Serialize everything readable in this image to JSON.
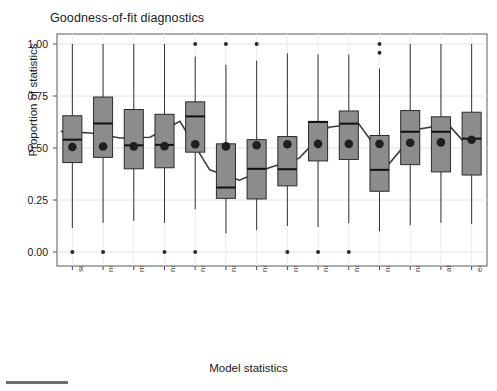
{
  "chart_data": {
    "type": "box",
    "title": "Goodness-of-fit diagnostics",
    "xlabel": "Model statistics",
    "ylabel": "Proportion of statistics",
    "ylim": [
      0.0,
      1.0
    ],
    "ytick_labels": [
      "0.00",
      "0.25",
      "0.50",
      "0.75",
      "1.00"
    ],
    "ytick_values": [
      0.0,
      0.25,
      0.5,
      0.75,
      1.0
    ],
    "grid": true,
    "legend": "none",
    "box_fill": "#8c8c8c",
    "box_stroke": "#2b2b2b",
    "mean_marker_color": "#1f1f1f",
    "mean_line_color": "#3d3d3d",
    "categories": [
      "sum",
      "nonzero",
      "mutual min",
      "nodeicovar",
      "nodeicovar",
      "nodeofactor.sum.Disc3 1",
      "nodeofactor.sum.Disc3 2",
      "nodeifactor.sum.Disc3.1",
      "nodeifactor.sum.Disc3.2",
      "nodematch.sum.Disc3",
      "nodeocov.sum.Citations",
      "nodeicov.sum.Citations",
      "absdiff.sum.Citations",
      "edgecov.sum.friend"
    ],
    "boxes": [
      {
        "category": "sum",
        "whisker_low": 0.115,
        "q1": 0.43,
        "median": 0.54,
        "q3": 0.655,
        "whisker_high": 1.0,
        "mean": 0.505,
        "outliers": [
          0.0
        ]
      },
      {
        "category": "nonzero",
        "whisker_low": 0.14,
        "q1": 0.455,
        "median": 0.618,
        "q3": 0.745,
        "whisker_high": 1.0,
        "mean": 0.507,
        "outliers": [
          0.0
        ]
      },
      {
        "category": "mutual min",
        "whisker_low": 0.15,
        "q1": 0.4,
        "median": 0.513,
        "q3": 0.685,
        "whisker_high": 1.0,
        "mean": 0.508,
        "outliers": []
      },
      {
        "category": "nodeicovar",
        "whisker_low": 0.14,
        "q1": 0.405,
        "median": 0.515,
        "q3": 0.662,
        "whisker_high": 1.0,
        "mean": 0.509,
        "outliers": [
          0.0
        ]
      },
      {
        "category": "nodeicovar",
        "whisker_low": 0.205,
        "q1": 0.48,
        "median": 0.652,
        "q3": 0.722,
        "whisker_high": 0.94,
        "mean": 0.518,
        "outliers": [
          0.0,
          1.0
        ]
      },
      {
        "category": "nodeofactor.sum.Disc3 1",
        "whisker_low": 0.09,
        "q1": 0.258,
        "median": 0.31,
        "q3": 0.52,
        "whisker_high": 0.9,
        "mean": 0.508,
        "outliers": [
          1.0
        ]
      },
      {
        "category": "nodeofactor.sum.Disc3 2",
        "whisker_low": 0.105,
        "q1": 0.255,
        "median": 0.4,
        "q3": 0.54,
        "whisker_high": 0.92,
        "mean": 0.513,
        "outliers": [
          1.0
        ]
      },
      {
        "category": "nodeifactor.sum.Disc3.1",
        "whisker_low": 0.125,
        "q1": 0.318,
        "median": 0.398,
        "q3": 0.555,
        "whisker_high": 0.955,
        "mean": 0.518,
        "outliers": [
          0.0
        ]
      },
      {
        "category": "nodeifactor.sum.Disc3.2",
        "whisker_low": 0.12,
        "q1": 0.438,
        "median": 0.625,
        "q3": 0.628,
        "whisker_high": 0.95,
        "mean": 0.52,
        "outliers": [
          0.0
        ]
      },
      {
        "category": "nodematch.sum.Disc3",
        "whisker_low": 0.138,
        "q1": 0.445,
        "median": 0.617,
        "q3": 0.678,
        "whisker_high": 0.95,
        "mean": 0.52,
        "outliers": [
          0.0
        ]
      },
      {
        "category": "nodeocov.sum.Citations",
        "whisker_low": 0.1,
        "q1": 0.292,
        "median": 0.395,
        "q3": 0.56,
        "whisker_high": 0.882,
        "mean": 0.52,
        "outliers": [
          1.0,
          0.958
        ]
      },
      {
        "category": "nodeicov.sum.Citations",
        "whisker_low": 0.128,
        "q1": 0.42,
        "median": 0.578,
        "q3": 0.68,
        "whisker_high": 1.0,
        "mean": 0.525,
        "outliers": []
      },
      {
        "category": "absdiff.sum.Citations",
        "whisker_low": 0.14,
        "q1": 0.385,
        "median": 0.578,
        "q3": 0.65,
        "whisker_high": 1.0,
        "mean": 0.527,
        "outliers": []
      },
      {
        "category": "edgecov.sum.friend",
        "whisker_low": 0.135,
        "q1": 0.37,
        "median": 0.545,
        "q3": 0.672,
        "whisker_high": 1.0,
        "mean": 0.54,
        "outliers": []
      }
    ],
    "mean_trend_line": [
      0.58,
      0.572,
      0.548,
      0.552,
      0.628,
      0.395,
      0.345,
      0.405,
      0.45,
      0.6,
      0.618,
      0.42,
      0.59,
      0.615,
      0.455
    ]
  }
}
